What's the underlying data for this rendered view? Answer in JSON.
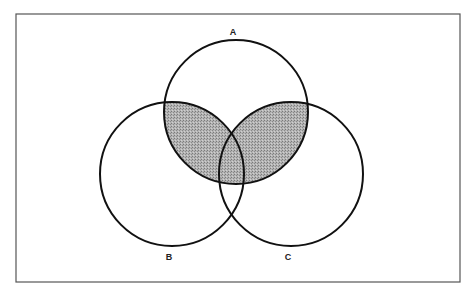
{
  "diagram": {
    "type": "venn",
    "frame": {
      "x": 16,
      "y": 14,
      "width": 444,
      "height": 268,
      "stroke": "#555555"
    },
    "sets": [
      {
        "id": "A",
        "label": "A",
        "cx": 236,
        "cy": 112,
        "r": 72,
        "label_x": 233,
        "label_y": 35
      },
      {
        "id": "B",
        "label": "B",
        "cx": 172,
        "cy": 174,
        "r": 72,
        "label_x": 169,
        "label_y": 260
      },
      {
        "id": "C",
        "label": "C",
        "cx": 291,
        "cy": 174,
        "r": 72,
        "label_x": 288,
        "label_y": 260
      }
    ],
    "shaded_region": "A ∩ (B ∪ C)",
    "shade_color": "#a9a9a9",
    "stroke_color": "#111111"
  }
}
